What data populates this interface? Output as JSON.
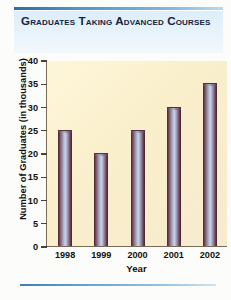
{
  "header": {
    "title": "Graduates Taking Advanced Courses",
    "rule_color": "#2b6ca8",
    "band_color": "#e1f0fa",
    "text_color": "#15243f"
  },
  "footer": {
    "rule_color": "#3f80b4"
  },
  "chart_data": {
    "type": "bar",
    "title": "Graduates Taking Advanced Courses",
    "categories": [
      "1998",
      "1999",
      "2000",
      "2001",
      "2002"
    ],
    "values": [
      25,
      20,
      25,
      30,
      35
    ],
    "xlabel": "Year",
    "ylabel": "Number of Graduates (in thousands)",
    "ylim": [
      0,
      40
    ],
    "ytick_step": 5,
    "yticks": [
      0,
      5,
      10,
      15,
      20,
      25,
      30,
      35,
      40
    ],
    "ytick_labels": [
      "0",
      "5",
      "10",
      "15",
      "20",
      "25",
      "30",
      "35",
      "40"
    ],
    "grid": false,
    "legend": null,
    "plot_background": "#faefcb",
    "bar_color": "#b9c3dc",
    "bar_edge_color": "#4a2330",
    "axis_color": "#7a6a55"
  }
}
